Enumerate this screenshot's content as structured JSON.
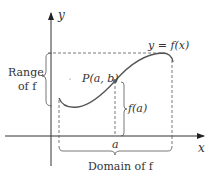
{
  "diagram": {
    "axes": {
      "x_label": "x",
      "y_label": "y"
    },
    "curve_label": "y = f(x)",
    "point_label": "P(a, b)",
    "value_label": "f(a)",
    "x_tick_label": "a",
    "range_label_line1": "Range",
    "range_label_line2": "of f",
    "domain_label": "Domain of f",
    "colors": {
      "curve": "#555555",
      "axes": "#333333",
      "dashes": "#555555",
      "text": "#333333"
    }
  }
}
